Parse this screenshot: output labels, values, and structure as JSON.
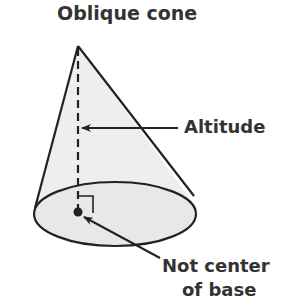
{
  "diagram": {
    "title": "Oblique cone",
    "labels": {
      "altitude": "Altitude",
      "not_center_line1": "Not center",
      "not_center_line2": "of base"
    },
    "colors": {
      "fill": "#eeeeee",
      "stroke": "#222222",
      "text": "#333333"
    }
  }
}
